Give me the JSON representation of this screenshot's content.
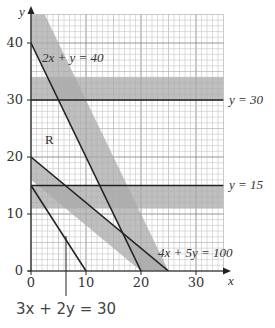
{
  "chart_data": {
    "type": "line",
    "title": "",
    "xlabel": "x",
    "ylabel": "y",
    "xlim": [
      0,
      35
    ],
    "ylim": [
      0,
      45
    ],
    "grid": true,
    "grid_minor_step": 1,
    "grid_major_step": 10,
    "x_ticks": [
      "0",
      "10",
      "20",
      "30"
    ],
    "y_ticks": [
      "0",
      "10",
      "20",
      "30",
      "40"
    ],
    "lines": [
      {
        "name": "2x + y = 40",
        "a": 2,
        "b": 1,
        "c": 40,
        "shaded_side": "greater",
        "band": [
          40,
          50
        ]
      },
      {
        "name": "4x + 5y = 100",
        "a": 4,
        "b": 5,
        "c": 100,
        "shaded_side": "less",
        "band": [
          80,
          100
        ]
      },
      {
        "name": "3x + 2y = 30",
        "a": 3,
        "b": 2,
        "c": 30,
        "shaded_side": "none"
      },
      {
        "name": "y = 30",
        "a": 0,
        "b": 1,
        "c": 30,
        "shaded_side": "greater",
        "band": [
          30,
          34
        ]
      },
      {
        "name": "y = 15",
        "a": 0,
        "b": 1,
        "c": 15,
        "shaded_side": "less",
        "band": [
          11,
          15
        ]
      }
    ],
    "annotations": [
      {
        "text": "R",
        "x": 3,
        "y": 24
      },
      {
        "text": "2x + y = 40",
        "x": 3,
        "y": 38
      },
      {
        "text": "y = 30",
        "x": 36,
        "y": 30
      },
      {
        "text": "y = 15",
        "x": 36,
        "y": 15
      },
      {
        "text": "4x + 5y = 100",
        "x": 24,
        "y": 4
      },
      {
        "text": "3x + 2y = 30",
        "x": 3,
        "y": -12
      }
    ],
    "shading_color": "#a9a9a9",
    "line_color": "#222222"
  },
  "labels": {
    "y_axis": "y",
    "x_axis": "x",
    "region": "R",
    "line1": "2x + y = 40",
    "line2_a": "y = 30",
    "line3": "y = 15",
    "line4": "4x + 5y = 100",
    "line5": "3x + 2y = 30",
    "ticks_x": [
      "0",
      "10",
      "20",
      "30"
    ],
    "ticks_y": [
      "0",
      "10",
      "20",
      "30",
      "40"
    ]
  }
}
